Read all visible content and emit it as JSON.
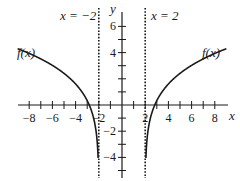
{
  "chart_data": {
    "type": "line",
    "title": "",
    "xlabel": "x",
    "ylabel": "y",
    "xlim": [
      -9,
      9
    ],
    "ylim": [
      -5.5,
      7
    ],
    "x_ticks": [
      -8,
      -6,
      -4,
      -2,
      2,
      4,
      6,
      8
    ],
    "y_ticks": [
      -4,
      -2,
      4,
      6
    ],
    "asymptotes": [
      {
        "label": "x = −2",
        "x": -2,
        "style": "dotted"
      },
      {
        "label": "x = 2",
        "x": 2,
        "style": "dotted"
      }
    ],
    "series": [
      {
        "name": "f(x)",
        "branch": "left",
        "label": "f(x)",
        "points": [
          [
            -9,
            3.4
          ],
          [
            -8,
            3.2
          ],
          [
            -6,
            2.7
          ],
          [
            -4,
            1.9
          ],
          [
            -3,
            1.0
          ],
          [
            -2.5,
            0.0
          ],
          [
            -2.2,
            -2.0
          ],
          [
            -2.1,
            -5.5
          ]
        ]
      },
      {
        "name": "f(x)",
        "branch": "right",
        "label": "f(x)",
        "points": [
          [
            9,
            3.4
          ],
          [
            8,
            3.2
          ],
          [
            6,
            2.7
          ],
          [
            4,
            1.9
          ],
          [
            3,
            1.0
          ],
          [
            2.5,
            0.0
          ],
          [
            2.2,
            -2.0
          ],
          [
            2.1,
            -5.5
          ]
        ]
      }
    ],
    "grid": false,
    "legend": "none"
  },
  "labels": {
    "asym_left": "x = −2",
    "asym_right": "x = 2",
    "curve_left": "f(x)",
    "curve_right": "f(x)",
    "x_axis": "x",
    "y_axis": "y"
  }
}
